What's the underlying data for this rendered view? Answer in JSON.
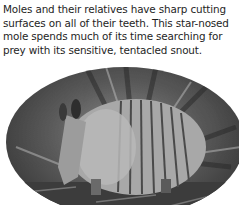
{
  "section": {
    "heading": "Insect Eaters",
    "paragraph_lines": [
      "Moles and their relatives have sharp cutting",
      "surfaces on all of their teeth. This star-nosed",
      "mole spends much of its time searching for",
      "prey with its sensitive, tentacled snout."
    ]
  },
  "photo": {
    "subject": "armadillo",
    "style": "grayscale oval vignette"
  }
}
